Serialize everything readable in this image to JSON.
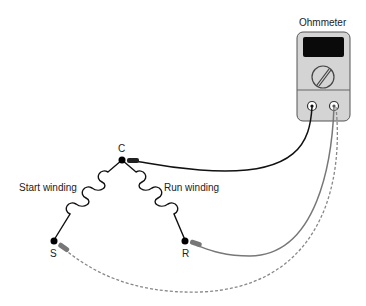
{
  "meter": {
    "title": "Ohmmeter"
  },
  "nodes": {
    "c": "C",
    "s": "S",
    "r": "R"
  },
  "windings": {
    "start": "Start winding",
    "run": "Run winding"
  },
  "colors": {
    "black_lead": "#111111",
    "gray_lead": "#777777",
    "dashed_lead": "#888888",
    "meter_body": "#d4d4d4"
  }
}
